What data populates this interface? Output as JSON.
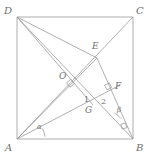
{
  "figure": {
    "kind": "geometry-diagram",
    "shape": "square",
    "width": 151,
    "height": 160,
    "colors": {
      "stroke": "#9a9a9a",
      "square_stroke": "#a5a5a5",
      "label": "#6f6f6f",
      "background": "#ffffff"
    }
  },
  "square": {
    "name": "ABCD",
    "left": 17,
    "top": 17,
    "right": 133,
    "bottom": 139
  },
  "vertices": [
    {
      "id": "D",
      "label": "D",
      "x": 17,
      "y": 17,
      "label_x": 4,
      "label_y": 6
    },
    {
      "id": "C",
      "label": "C",
      "x": 133,
      "y": 17,
      "label_x": 136,
      "label_y": 6
    },
    {
      "id": "A",
      "label": "A",
      "x": 17,
      "y": 139,
      "label_x": 5,
      "label_y": 143
    },
    {
      "id": "B",
      "label": "B",
      "x": 133,
      "y": 139,
      "label_x": 136,
      "label_y": 143
    }
  ],
  "points": [
    {
      "id": "E",
      "label": "E",
      "x": 97,
      "y": 58,
      "label_x": 92,
      "label_y": 42
    },
    {
      "id": "O",
      "label": "O",
      "x": 70,
      "y": 84,
      "label_x": 59,
      "label_y": 72
    },
    {
      "id": "F",
      "label": "F",
      "x": 111,
      "y": 92,
      "label_x": 115,
      "label_y": 82
    },
    {
      "id": "G",
      "label": "G",
      "x": 93,
      "y": 105,
      "label_x": 85,
      "label_y": 106
    }
  ],
  "segments": [
    {
      "id": "side-DC",
      "from": "D",
      "to": "C",
      "kind": "square-side"
    },
    {
      "id": "side-CB",
      "from": "C",
      "to": "B",
      "kind": "square-side"
    },
    {
      "id": "side-BA",
      "from": "B",
      "to": "A",
      "kind": "square-side"
    },
    {
      "id": "side-AD",
      "from": "A",
      "to": "D",
      "kind": "square-side"
    },
    {
      "id": "diagonal-A-C",
      "from": "A",
      "to": "C",
      "kind": "diagonal"
    },
    {
      "id": "diagonal-D-B",
      "from": "D",
      "to": "B",
      "kind": "diagonal"
    },
    {
      "id": "cevian-D-E-B",
      "from": "D",
      "to": "B",
      "kind": "cevian-through-E"
    },
    {
      "id": "cevian-A-E",
      "from": "A",
      "to": "E",
      "kind": "cevian"
    },
    {
      "id": "cevian-D-G",
      "from": "D",
      "to": "G",
      "kind": "cevian"
    },
    {
      "id": "cevian-E-B",
      "from": "E",
      "to": "B",
      "kind": "cevian"
    },
    {
      "id": "cevian-A-F",
      "from": "A",
      "to": "F",
      "kind": "cevian"
    }
  ],
  "angle_marks": [
    {
      "id": "alpha",
      "label": "α",
      "type": "arc",
      "at": "A",
      "x": 37,
      "y": 124
    },
    {
      "id": "beta",
      "label": "β",
      "type": "arc",
      "at": "B",
      "x": 117,
      "y": 107
    },
    {
      "id": "one",
      "label": "1",
      "type": "numbered",
      "at": "G",
      "x": 84,
      "y": 96
    },
    {
      "id": "two",
      "label": "2",
      "type": "numbered",
      "at": "G",
      "x": 101,
      "y": 98
    }
  ],
  "right_angles": [
    {
      "id": "right-angle-at-O",
      "at": "O",
      "x": 70,
      "y": 84
    },
    {
      "id": "right-angle-at-F",
      "at": "F",
      "x": 108,
      "y": 87
    },
    {
      "id": "right-angle-at-B",
      "at": "B",
      "x": 124,
      "y": 127
    }
  ]
}
